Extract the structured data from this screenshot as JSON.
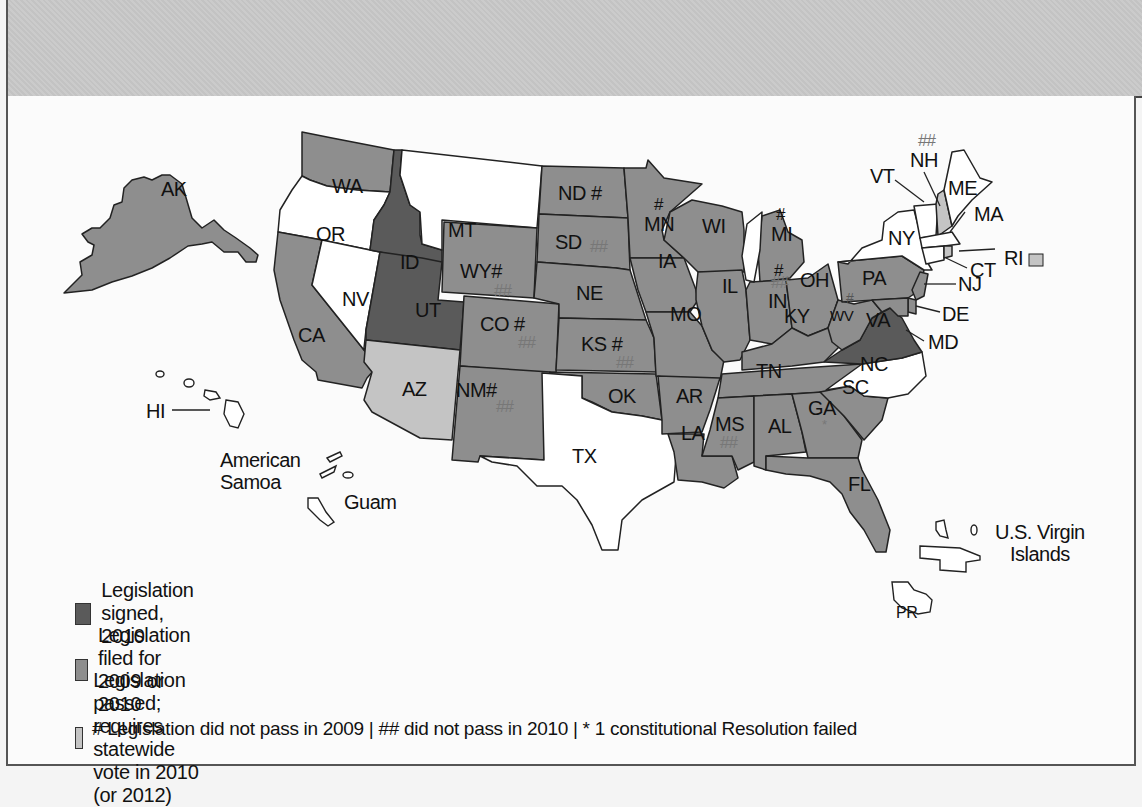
{
  "colors": {
    "signed": "#5a5a5a",
    "filed": "#8e8e8e",
    "passed_vote": "#c4c4c4",
    "none": "#ffffff",
    "outline": "#222222"
  },
  "legend": {
    "items": [
      {
        "key": "signed",
        "label": "Legislation signed, 2010"
      },
      {
        "key": "filed",
        "label": "Legislation filed for 2009 or 2010"
      },
      {
        "key": "passed_vote",
        "label": "Legislation passed; requires statewide vote in 2010 (or 2012)"
      }
    ],
    "footnote": "# Legislation did not pass in 2009 | ## did not pass in 2010 | * 1 constitutional Resolution failed"
  },
  "map": {
    "states": [
      {
        "code": "AK",
        "status": "filed"
      },
      {
        "code": "WA",
        "status": "filed",
        "marks": "*"
      },
      {
        "code": "OR",
        "status": "none"
      },
      {
        "code": "CA",
        "status": "filed"
      },
      {
        "code": "NV",
        "status": "none"
      },
      {
        "code": "ID",
        "status": "signed"
      },
      {
        "code": "UT",
        "status": "signed"
      },
      {
        "code": "AZ",
        "status": "passed_vote"
      },
      {
        "code": "MT",
        "status": "none"
      },
      {
        "code": "WY",
        "status": "filed",
        "marks": "# ##"
      },
      {
        "code": "CO",
        "status": "filed",
        "marks": "# ##"
      },
      {
        "code": "NM",
        "status": "filed",
        "marks": "# ##"
      },
      {
        "code": "ND",
        "status": "filed",
        "marks": "#"
      },
      {
        "code": "SD",
        "status": "filed",
        "marks": "##"
      },
      {
        "code": "NE",
        "status": "filed"
      },
      {
        "code": "KS",
        "status": "filed",
        "marks": "# ##"
      },
      {
        "code": "OK",
        "status": "filed"
      },
      {
        "code": "TX",
        "status": "none"
      },
      {
        "code": "MN",
        "status": "filed",
        "marks": "#"
      },
      {
        "code": "IA",
        "status": "filed"
      },
      {
        "code": "MO",
        "status": "filed"
      },
      {
        "code": "AR",
        "status": "filed"
      },
      {
        "code": "LA",
        "status": "filed"
      },
      {
        "code": "WI",
        "status": "filed"
      },
      {
        "code": "IL",
        "status": "filed"
      },
      {
        "code": "MI",
        "status": "filed",
        "marks": "#"
      },
      {
        "code": "IN",
        "status": "filed",
        "marks": "# ##"
      },
      {
        "code": "OH",
        "status": "filed"
      },
      {
        "code": "KY",
        "status": "filed"
      },
      {
        "code": "TN",
        "status": "filed"
      },
      {
        "code": "MS",
        "status": "filed",
        "marks": "##"
      },
      {
        "code": "AL",
        "status": "filed"
      },
      {
        "code": "GA",
        "status": "filed",
        "marks": "*"
      },
      {
        "code": "FL",
        "status": "filed"
      },
      {
        "code": "SC",
        "status": "filed"
      },
      {
        "code": "NC",
        "status": "none"
      },
      {
        "code": "VA",
        "status": "signed"
      },
      {
        "code": "WV",
        "status": "filed",
        "marks": "# ##"
      },
      {
        "code": "PA",
        "status": "filed"
      },
      {
        "code": "NY",
        "status": "none"
      },
      {
        "code": "VT",
        "status": "none"
      },
      {
        "code": "NH",
        "status": "passed_vote",
        "marks": "##"
      },
      {
        "code": "ME",
        "status": "none"
      },
      {
        "code": "MA",
        "status": "none"
      },
      {
        "code": "RI",
        "status": "passed_vote"
      },
      {
        "code": "CT",
        "status": "none"
      },
      {
        "code": "NJ",
        "status": "filed"
      },
      {
        "code": "DE",
        "status": "filed"
      },
      {
        "code": "MD",
        "status": "filed"
      },
      {
        "code": "HI",
        "status": "none"
      }
    ],
    "territories": [
      {
        "name": "American Samoa",
        "line1": "American",
        "line2": "Samoa"
      },
      {
        "name": "Guam"
      },
      {
        "name": "U.S. Virgin Islands",
        "line1": "U.S. Virgin",
        "line2": "Islands"
      },
      {
        "name": "PR"
      }
    ],
    "labels": {
      "AK": "AK",
      "WA": "WA",
      "OR": "OR",
      "CA": "CA",
      "NV": "NV",
      "ID": "ID",
      "UT": "UT",
      "AZ": "AZ",
      "MT": "MT",
      "WY": "WY#",
      "CO": "CO #",
      "NM": "NM#",
      "ND": "ND #",
      "SD": "SD",
      "NE": "NE",
      "KS": "KS #",
      "OK": "OK",
      "TX": "TX",
      "MN": "MN",
      "IA": "IA",
      "MO": "MO",
      "AR": "AR",
      "LA": "LA",
      "WI": "WI",
      "IL": "IL",
      "MI": "MI",
      "IN": "IN",
      "OH": "OH",
      "KY": "KY",
      "TN": "TN",
      "MS": "MS",
      "AL": "AL",
      "GA": "GA",
      "FL": "FL",
      "SC": "SC",
      "NC": "NC",
      "VA": "VA",
      "WV": "WV",
      "PA": "PA",
      "NY": "NY",
      "VT": "VT",
      "NH": "NH",
      "ME": "ME",
      "MA": "MA",
      "RI": "RI",
      "CT": "CT",
      "NJ": "NJ",
      "DE": "DE",
      "MD": "MD",
      "HI": "HI",
      "PR": "PR",
      "GUAM": "Guam"
    },
    "marks": {
      "hash": "#",
      "double_hash": "##",
      "asterisk": "*"
    }
  }
}
